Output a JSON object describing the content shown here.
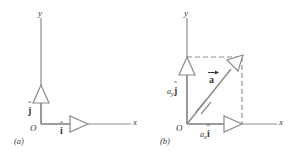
{
  "figure": {
    "stroke_color": "#8c8c8c",
    "text_color": "#3a3a3a",
    "background": "#ffffff",
    "panels": [
      {
        "key": "a",
        "caption": "(a)",
        "origin_label": "O",
        "x_axis_label": "x",
        "y_axis_label": "y",
        "vectors": [
          {
            "name": "i-hat",
            "base": "i",
            "hat": "ˆ",
            "subscript": ""
          },
          {
            "name": "j-hat",
            "base": "j",
            "hat": "ˆ",
            "subscript": ""
          }
        ]
      },
      {
        "key": "b",
        "caption": "(b)",
        "origin_label": "O",
        "x_axis_label": "x",
        "y_axis_label": "y",
        "vector_label": {
          "base": "a",
          "arrow": "→"
        },
        "components": [
          {
            "name": "ax-i-hat",
            "sub": "x",
            "base": "i",
            "hat": "ˆ",
            "prefix": "a"
          },
          {
            "name": "ay-j-hat",
            "sub": "y",
            "base": "j",
            "hat": "ˆ",
            "prefix": "a"
          }
        ]
      }
    ]
  }
}
